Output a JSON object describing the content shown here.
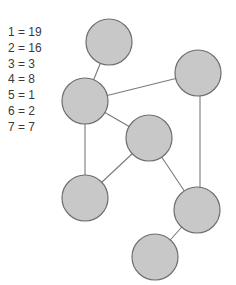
{
  "legend": [
    {
      "label": "1 = 19"
    },
    {
      "label": "2 = 16"
    },
    {
      "label": "3 = 3"
    },
    {
      "label": "4 = 8"
    },
    {
      "label": "5 = 1"
    },
    {
      "label": "6 = 2"
    },
    {
      "label": "7 = 7"
    }
  ],
  "graph": {
    "node_fill": "#c8c8c8",
    "node_stroke": "#6e6e6e",
    "edge_color": "#7a7a7a",
    "node_radius": 23,
    "nodes": [
      {
        "id": "top",
        "cx": 109,
        "cy": 42
      },
      {
        "id": "left-mid",
        "cx": 85,
        "cy": 101
      },
      {
        "id": "right",
        "cx": 198,
        "cy": 73
      },
      {
        "id": "center",
        "cx": 149,
        "cy": 138
      },
      {
        "id": "bottom-left",
        "cx": 85,
        "cy": 198
      },
      {
        "id": "bottom-right",
        "cx": 197,
        "cy": 210
      },
      {
        "id": "bottom",
        "cx": 155,
        "cy": 257
      }
    ],
    "edges": [
      {
        "from": "top",
        "to": "left-mid",
        "x1": 109,
        "y1": 42,
        "x2": 85,
        "y2": 101
      },
      {
        "from": "left-mid",
        "to": "right",
        "x1": 85,
        "y1": 101,
        "x2": 198,
        "y2": 73
      },
      {
        "from": "left-mid",
        "to": "center",
        "x1": 85,
        "y1": 101,
        "x2": 149,
        "y2": 138
      },
      {
        "from": "left-mid",
        "to": "bottom-left",
        "x1": 85,
        "y1": 101,
        "x2": 85,
        "y2": 198
      },
      {
        "from": "right",
        "to": "bottom-right",
        "x1": 200,
        "y1": 73,
        "x2": 200,
        "y2": 210
      },
      {
        "from": "center",
        "to": "bottom-left",
        "x1": 149,
        "y1": 138,
        "x2": 85,
        "y2": 198
      },
      {
        "from": "center",
        "to": "bottom-right",
        "x1": 149,
        "y1": 138,
        "x2": 197,
        "y2": 210
      },
      {
        "from": "bottom-right",
        "to": "bottom",
        "x1": 197,
        "y1": 210,
        "x2": 155,
        "y2": 257
      }
    ]
  }
}
